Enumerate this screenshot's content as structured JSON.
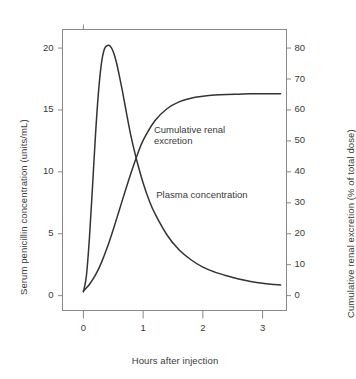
{
  "chart_data": {
    "type": "line",
    "title": "",
    "xlabel": "Hours after injection",
    "ylabel": "Serum penicillin concentration (units/mL)",
    "y2label": "Cumulative renal excretion (% of total dose)",
    "xlim": [
      -0.35,
      3.4
    ],
    "ylim": [
      -1.2,
      21.5
    ],
    "y2lim": [
      -4.8,
      86
    ],
    "grid": false,
    "legend_position": "inline-annotations",
    "xticks": [
      "0",
      "1",
      "2",
      "3"
    ],
    "xtick_values": [
      0,
      1,
      2,
      3
    ],
    "yticks": [
      "0",
      "5",
      "10",
      "15",
      "20"
    ],
    "ytick_values": [
      0,
      5,
      10,
      15,
      20
    ],
    "y2ticks": [
      "0",
      "10",
      "20",
      "30",
      "40",
      "50",
      "60",
      "70",
      "80"
    ],
    "y2tick_values": [
      0,
      10,
      20,
      30,
      40,
      50,
      60,
      70,
      80
    ],
    "annotations": [
      {
        "name": "cumulative-renal-excretion-label",
        "text": "Cumulative renal\nexcretion",
        "x": 1.18,
        "y": 13.4
      },
      {
        "name": "plasma-concentration-label",
        "text": "Plasma concentration",
        "x": 1.22,
        "y": 8.1
      }
    ],
    "series": [
      {
        "name": "Plasma concentration",
        "axis": "left",
        "units": "units/mL",
        "color": "#333333",
        "x": [
          0.0,
          0.05,
          0.1,
          0.15,
          0.2,
          0.25,
          0.3,
          0.35,
          0.4,
          0.45,
          0.5,
          0.55,
          0.6,
          0.65,
          0.7,
          0.8,
          0.9,
          1.0,
          1.1,
          1.2,
          1.4,
          1.6,
          1.8,
          2.0,
          2.2,
          2.4,
          2.6,
          2.8,
          3.0,
          3.2,
          3.3
        ],
        "y": [
          0.3,
          1.6,
          4.6,
          8.6,
          12.8,
          16.3,
          18.7,
          19.9,
          20.2,
          20.15,
          19.7,
          18.9,
          17.8,
          16.6,
          15.3,
          12.8,
          10.8,
          9.1,
          7.7,
          6.6,
          4.9,
          3.7,
          2.9,
          2.3,
          1.9,
          1.6,
          1.35,
          1.15,
          1.0,
          0.9,
          0.85
        ]
      },
      {
        "name": "Cumulative renal excretion",
        "axis": "right",
        "units": "% of total dose",
        "color": "#333333",
        "x": [
          0.0,
          0.1,
          0.2,
          0.3,
          0.4,
          0.5,
          0.6,
          0.7,
          0.8,
          0.9,
          1.0,
          1.2,
          1.4,
          1.6,
          1.8,
          2.0,
          2.2,
          2.4,
          2.6,
          2.8,
          3.0,
          3.2,
          3.3
        ],
        "y": [
          1.5,
          3.6,
          6.6,
          10.6,
          15.6,
          21.4,
          27.6,
          33.8,
          39.8,
          45.4,
          50.2,
          56.6,
          60.4,
          62.6,
          63.8,
          64.4,
          64.8,
          65.0,
          65.1,
          65.2,
          65.2,
          65.2,
          65.2
        ]
      }
    ]
  },
  "axes": {
    "left_title": "Serum penicillin concentration (units/mL)",
    "right_title": "Cumulative renal excretion (% of total dose)",
    "bottom_title": "Hours after injection"
  },
  "style": {
    "background": "#ffffff",
    "frame_color": "#888888",
    "line_color": "#333333",
    "text_color": "#3a3a3a"
  }
}
